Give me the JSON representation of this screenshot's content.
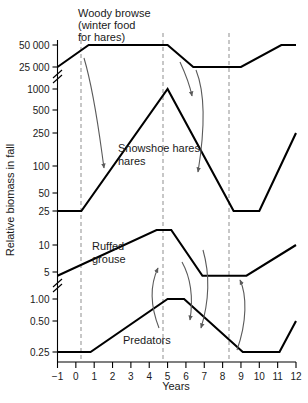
{
  "chart_data": {
    "type": "line",
    "title": "",
    "xlabel": "Years",
    "ylabel": "Relative biomass in fall",
    "grid": false,
    "legend": "inline-labels",
    "x": [
      -1,
      0,
      1,
      2,
      3,
      4,
      5,
      6,
      7,
      8,
      9,
      10,
      11,
      12
    ],
    "xlim": [
      -1,
      12
    ],
    "xticks": [
      "−1",
      "0",
      "1",
      "2",
      "3",
      "4",
      "5",
      "6",
      "7",
      "8",
      "9",
      "10",
      "11",
      "12"
    ],
    "yticks": [
      "50 000",
      "25 000",
      "1000",
      "500",
      "250",
      "100",
      "50",
      "25",
      "10",
      "5",
      "1.00",
      "0.50",
      "0.25"
    ],
    "y_axis_note": "broken logarithmic axis, two breaks: between 25 000 and 1000, and between 5 and 1.00",
    "annotations": [
      {
        "name": "woody-browse-caption",
        "text": [
          "Woody browse",
          "(winter food",
          "for hares)"
        ]
      }
    ],
    "vertical_markers": [
      0,
      5,
      9
    ],
    "series": [
      {
        "name": "Woody browse",
        "label": "Woody browse (winter food for hares)",
        "points": [
          {
            "x": -1.0,
            "y": 25000
          },
          {
            "x": 0.7,
            "y": 50000
          },
          {
            "x": 5.0,
            "y": 50000
          },
          {
            "x": 6.4,
            "y": 25000
          },
          {
            "x": 9.0,
            "y": 25000
          },
          {
            "x": 11.2,
            "y": 50000
          },
          {
            "x": 12.0,
            "y": 50000
          }
        ]
      },
      {
        "name": "Snowshoe hares",
        "label": "Snowshoe hares",
        "points": [
          {
            "x": -1.0,
            "y": 25
          },
          {
            "x": 0.3,
            "y": 25
          },
          {
            "x": 5.0,
            "y": 1000
          },
          {
            "x": 8.6,
            "y": 25
          },
          {
            "x": 10.0,
            "y": 25
          },
          {
            "x": 12.0,
            "y": 250
          }
        ]
      },
      {
        "name": "Ruffed grouse",
        "label": "Ruffed grouse",
        "points": [
          {
            "x": -1.0,
            "y": 4
          },
          {
            "x": 4.4,
            "y": 15
          },
          {
            "x": 5.2,
            "y": 15
          },
          {
            "x": 6.9,
            "y": 4
          },
          {
            "x": 9.3,
            "y": 4
          },
          {
            "x": 12.0,
            "y": 10
          }
        ]
      },
      {
        "name": "Predators",
        "label": "Predators",
        "points": [
          {
            "x": -1.0,
            "y": 0.25
          },
          {
            "x": 0.8,
            "y": 0.25
          },
          {
            "x": 5.0,
            "y": 1.0
          },
          {
            "x": 5.9,
            "y": 1.0
          },
          {
            "x": 9.1,
            "y": 0.25
          },
          {
            "x": 11.1,
            "y": 0.25
          },
          {
            "x": 12.0,
            "y": 0.5
          }
        ]
      }
    ],
    "colors": {
      "curve": "#000000",
      "marker_line": "#9a9a9a",
      "arrow": "#5a5a5a",
      "text": "#1a1a1a",
      "background": "#ffffff"
    }
  }
}
